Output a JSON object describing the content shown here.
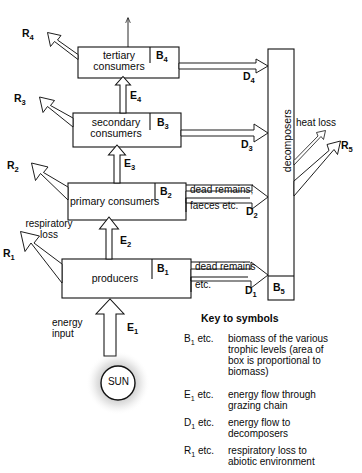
{
  "diagram": {
    "boxes": [
      {
        "id": "tertiary",
        "label": "tertiary\nconsumers",
        "biomass_symbol": "B",
        "biomass_sub": "4"
      },
      {
        "id": "secondary",
        "label": "secondary\nconsumers",
        "biomass_symbol": "B",
        "biomass_sub": "3"
      },
      {
        "id": "primary",
        "label": "primary consumers",
        "biomass_symbol": "B",
        "biomass_sub": "2"
      },
      {
        "id": "producers",
        "label": "producers",
        "biomass_symbol": "B",
        "biomass_sub": "1"
      },
      {
        "id": "decomposers",
        "label": "decomposers",
        "biomass_symbol": "B",
        "biomass_sub": "5"
      }
    ],
    "energy_flows": [
      {
        "symbol": "E",
        "sub": "4"
      },
      {
        "symbol": "E",
        "sub": "3"
      },
      {
        "symbol": "E",
        "sub": "2"
      },
      {
        "symbol": "E",
        "sub": "1"
      }
    ],
    "decomposer_flows": [
      {
        "symbol": "D",
        "sub": "4"
      },
      {
        "symbol": "D",
        "sub": "3"
      },
      {
        "symbol": "D",
        "sub": "2"
      },
      {
        "symbol": "D",
        "sub": "1"
      }
    ],
    "respiratory_flows": [
      {
        "symbol": "R",
        "sub": "4"
      },
      {
        "symbol": "R",
        "sub": "3"
      },
      {
        "symbol": "R",
        "sub": "2"
      },
      {
        "symbol": "R",
        "sub": "1"
      },
      {
        "symbol": "R",
        "sub": "5"
      }
    ],
    "annotations": {
      "dead_remains_comma": "dead remains,",
      "faeces_etc": "faeces etc.",
      "dead_remains": "dead remains",
      "etc": "etc.",
      "respiratory_loss": "respiratory\nloss",
      "energy_input": "energy\ninput",
      "heat_loss": "heat loss",
      "sun": "SUN"
    }
  },
  "key": {
    "title": "Key to symbols",
    "entries": [
      {
        "symbol": "B",
        "sub": "1",
        "suffix": " etc.",
        "description": "biomass of the various\ntrophic levels (area of\nbox is proportional to\nbiomass)"
      },
      {
        "symbol": "E",
        "sub": "1",
        "suffix": " etc.",
        "description": "energy flow through\ngrazing chain"
      },
      {
        "symbol": "D",
        "sub": "1",
        "suffix": " etc.",
        "description": "energy flow to\ndecomposers"
      },
      {
        "symbol": "R",
        "sub": "1",
        "suffix": " etc.",
        "description": "respiratory loss to\nabiotic environment"
      }
    ]
  },
  "colors": {
    "stroke": "#111111",
    "text": "#0a0a0a",
    "background": "#ffffff"
  }
}
